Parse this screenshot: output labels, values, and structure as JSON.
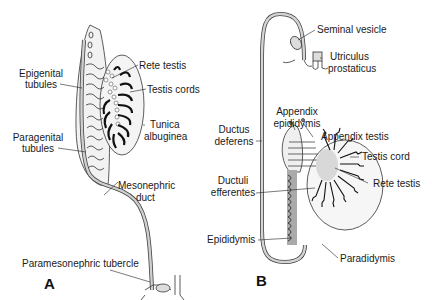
{
  "panel_a": {
    "letter": "A",
    "labels": {
      "rete_testis": "Rete testis",
      "epigenital_1": "Epigenital",
      "epigenital_2": "tubules",
      "testis_cords": "Testis cords",
      "tunica_1": "Tunica",
      "tunica_2": "albuginea",
      "paragenital_1": "Paragenital",
      "paragenital_2": "tubules",
      "mesonephric_1": "Mesonephric",
      "mesonephric_2": "duct",
      "paramesonephric": "Paramesonephric tubercle"
    }
  },
  "panel_b": {
    "letter": "B",
    "labels": {
      "seminal_vesicle": "Seminal vesicle",
      "utriculus_1": "Utriculus",
      "utriculus_2": "prostaticus",
      "appendix_epididymis_1": "Appendix",
      "appendix_epididymis_2": "epididymis",
      "ductus_1": "Ductus",
      "ductus_2": "deferens",
      "appendix_testis": "Appendix testis",
      "testis_cord": "Testis cord",
      "ductuli_1": "Ductuli",
      "ductuli_2": "efferentes",
      "rete_testis": "Rete testis",
      "epididymis": "Epididymis",
      "paradidymis": "Paradidymis"
    }
  }
}
